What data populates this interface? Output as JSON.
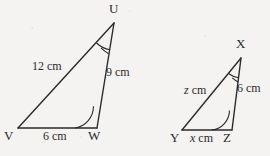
{
  "figure": {
    "background_color": "#f4f3f1",
    "stroke_color": "#2b2b2b"
  },
  "triangles": [
    {
      "name": "triangle-uvw",
      "vertices": {
        "apex": {
          "label": "U",
          "x": 114,
          "y": 23,
          "label_x": 109,
          "label_y": 2
        },
        "left": {
          "label": "V",
          "x": 18,
          "y": 128,
          "label_x": 4,
          "label_y": 129
        },
        "right": {
          "label": "W",
          "x": 97,
          "y": 128,
          "label_x": 88,
          "label_y": 129
        }
      },
      "sides": [
        {
          "name": "side-uv",
          "text": "12 cm",
          "x": 32,
          "y": 60
        },
        {
          "name": "side-uw",
          "text": "9 cm",
          "x": 106,
          "y": 66
        },
        {
          "name": "side-vw",
          "text": "6 cm",
          "x": 43,
          "y": 130
        }
      ],
      "angles": [
        {
          "name": "angle-u",
          "marks": 2
        },
        {
          "name": "angle-w",
          "marks": 1
        }
      ]
    },
    {
      "name": "triangle-xyz",
      "vertices": {
        "apex": {
          "label": "X",
          "x": 241,
          "y": 58,
          "label_x": 236,
          "label_y": 37
        },
        "left": {
          "label": "Y",
          "x": 182,
          "y": 130,
          "label_x": 170,
          "label_y": 131
        },
        "right": {
          "label": "Z",
          "x": 232,
          "y": 130,
          "label_x": 223,
          "label_y": 131
        }
      },
      "sides": [
        {
          "name": "side-xy",
          "text": "z cm",
          "italic_prefix": "z",
          "rest": " cm",
          "x": 184,
          "y": 84
        },
        {
          "name": "side-xz",
          "text": "6 cm",
          "x": 237,
          "y": 82
        },
        {
          "name": "side-yz",
          "text": "x cm",
          "italic_prefix": "x",
          "rest": " cm",
          "x": 190,
          "y": 132
        }
      ],
      "angles": [
        {
          "name": "angle-x",
          "marks": 2
        },
        {
          "name": "angle-z",
          "marks": 1
        }
      ]
    }
  ]
}
